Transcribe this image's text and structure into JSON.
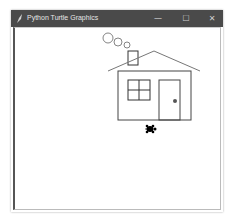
{
  "window": {
    "title": "Python Turtle Graphics",
    "controls": {
      "minimize": "—",
      "maximize": "☐",
      "close": "✕"
    },
    "titlebar_color": "#4a4a4a"
  },
  "canvas": {
    "background": "#ffffff",
    "line_color": "#333333",
    "smoke_circles": [
      {
        "cx": 108,
        "cy": 38,
        "r": 5
      },
      {
        "cx": 118,
        "cy": 42,
        "r": 4
      },
      {
        "cx": 127,
        "cy": 45,
        "r": 3
      }
    ],
    "chimney": {
      "x": 128,
      "y": 51,
      "w": 10,
      "h": 14
    },
    "roof": {
      "left": [
        108,
        71
      ],
      "apex": [
        154,
        51
      ],
      "right": [
        200,
        71
      ]
    },
    "walls": {
      "x": 118,
      "y": 71,
      "w": 73,
      "h": 49
    },
    "window_frame": {
      "x": 128,
      "y": 80,
      "w": 22,
      "h": 20
    },
    "door": {
      "x": 159,
      "y": 80,
      "w": 21,
      "h": 40
    },
    "door_knob": {
      "cx": 175,
      "cy": 101,
      "r": 2,
      "color": "#555555"
    },
    "turtle": {
      "x": 150,
      "y": 129,
      "heading": "east",
      "color": "#000000"
    }
  }
}
